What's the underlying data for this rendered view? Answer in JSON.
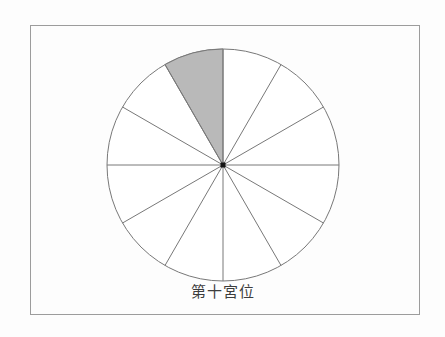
{
  "figure": {
    "label": "第十宮位",
    "background_color": "#fdfdfd",
    "frame": {
      "border_color": "#9c9c9c"
    },
    "label_color": "#3d3d3d",
    "wheel": {
      "sector_count": 12,
      "sector_angle_deg": 30,
      "highlighted_sector_number": 10,
      "highlight_start_deg_cw_from_top": 330,
      "highlight_end_deg_cw_from_top": 360,
      "fill": "#ffffff",
      "highlight_fill": "#b9b9b9",
      "line_color": "#787878",
      "center_dot_color": "#141414"
    }
  }
}
